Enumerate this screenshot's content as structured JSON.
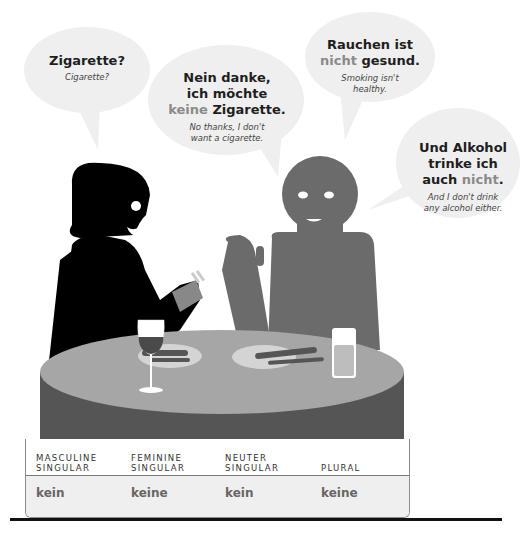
{
  "bubbles": [
    {
      "german": "Zigarette?",
      "english": "Cigarette?"
    },
    {
      "german_line1": "Nein danke,",
      "german_line2": "ich möchte",
      "german_neg": "keine",
      "german_rest": " Zigarette.",
      "english_line1": "No thanks, I don't",
      "english_line2": "want a cigarette."
    },
    {
      "german_line1": "Rauchen ist",
      "german_neg": "nicht",
      "german_rest": " gesund.",
      "english_line1": "Smoking isn't",
      "english_line2": "healthy."
    },
    {
      "german_line1": "Und Alkohol",
      "german_line2": "trinke ich",
      "german_pre": "auch ",
      "german_neg": "nicht",
      "german_rest": ".",
      "english_line1": "And I don't drink",
      "english_line2": "any alcohol either."
    }
  ],
  "table": {
    "headers": [
      {
        "line1": "MASCULINE",
        "line2": "SINGULAR"
      },
      {
        "line1": "FEMININE",
        "line2": "SINGULAR"
      },
      {
        "line1": "NEUTER",
        "line2": "SINGULAR"
      },
      {
        "line1": "",
        "line2": "PLURAL"
      }
    ],
    "values": [
      "kein",
      "keine",
      "kein",
      "keine"
    ]
  },
  "colors": {
    "bubble": "#efefef",
    "woman": "#000000",
    "man": "#6b6b6b",
    "table_top": "#a6a6a6",
    "table_side": "#555555",
    "negation_text": "#8a8a8a"
  }
}
